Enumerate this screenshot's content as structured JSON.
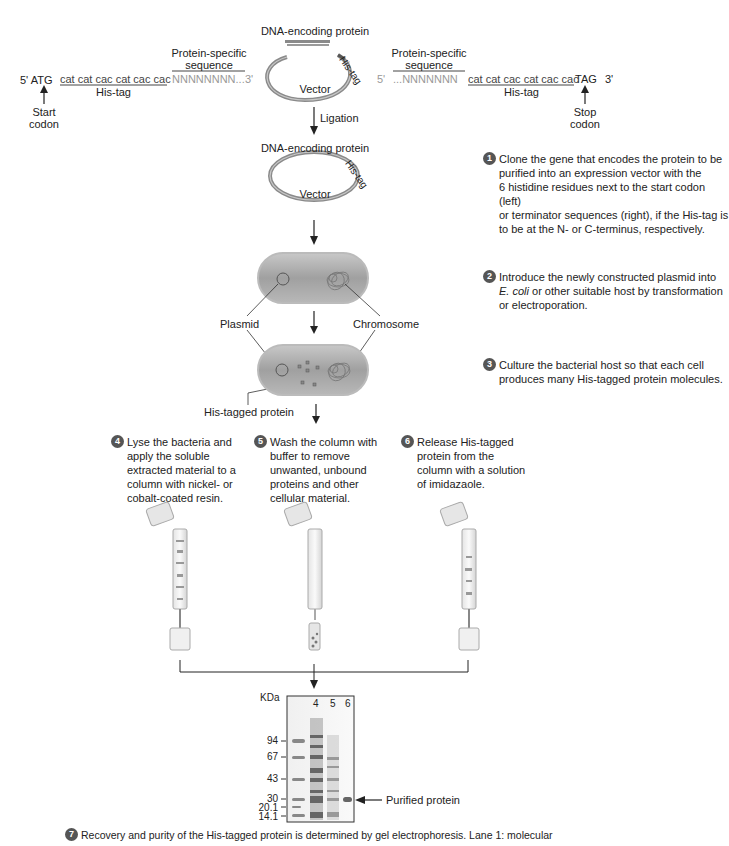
{
  "top_left": {
    "prefix": "5' ATG",
    "his_codons": "cat cat cac cat cac cac",
    "his_label": "His-tag",
    "protein_label_line1": "Protein-specific",
    "protein_label_line2": "sequence",
    "protein_seq": "NNNNNNNN...",
    "suffix": "3'",
    "start_label_line1": "Start",
    "start_label_line2": "codon"
  },
  "top_right": {
    "prefix": "5'",
    "protein_label_line1": "Protein-specific",
    "protein_label_line2": "sequence",
    "protein_seq": "...NNNNNNN",
    "his_codons": "cat cat cac cat cac cac",
    "stop": "TAG",
    "suffix": "3'",
    "his_label": "His-tag",
    "stop_label_line1": "Stop",
    "stop_label_line2": "codon"
  },
  "vector_top": {
    "dna_label": "DNA-encoding protein",
    "his_tag": "His-tag",
    "vector_label": "Vector"
  },
  "ligation": "Ligation",
  "vector_ligated": {
    "dna_label": "DNA-encoding protein",
    "his_tag": "His-tag",
    "vector_label": "Vector"
  },
  "cell_labels": {
    "plasmid": "Plasmid",
    "chromosome": "Chromosome",
    "his_tagged_protein": "His-tagged protein"
  },
  "steps": [
    {
      "num": "1",
      "text": "Clone the gene that encodes the protein to be\npurified into an expression vector with the\n6 histidine residues next to the start codon (left)\nor terminator sequences (right), if the His-tag is\nto be at the N- or C-terminus, respectively."
    },
    {
      "num": "2",
      "text_pre": "Introduce the newly constructed plasmid into",
      "text_italic": "E. coli",
      "text_post": " or other suitable host by transformation\nor electroporation."
    },
    {
      "num": "3",
      "text": "Culture the bacterial host so that each cell\nproduces many His-tagged protein molecules."
    },
    {
      "num": "4",
      "text": "Lyse the bacteria and\napply the soluble\nextracted material to a\ncolumn with nickel- or\ncobalt-coated resin."
    },
    {
      "num": "5",
      "text": "Wash the column with\nbuffer to remove\nunwanted, unbound\nproteins and other\ncellular material."
    },
    {
      "num": "6",
      "text": "Release His-tagged\nprotein from the\ncolumn with a solution\nof imidazaole."
    },
    {
      "num": "7",
      "text": "Recovery and purity of the His-tagged protein is determined by gel electrophoresis. Lane 1: molecular"
    }
  ],
  "gel": {
    "unit_label": "KDa",
    "lanes": [
      "4",
      "5",
      "6"
    ],
    "markers": [
      "94",
      "67",
      "43",
      "30",
      "20.1",
      "14.1"
    ],
    "arrow_label": "Purified protein"
  },
  "colors": {
    "badge": "#555555",
    "cell_fill": "#9a9a9a",
    "vector_ring": "#8a8a8a",
    "text": "#222222",
    "gray_text": "#999999"
  }
}
